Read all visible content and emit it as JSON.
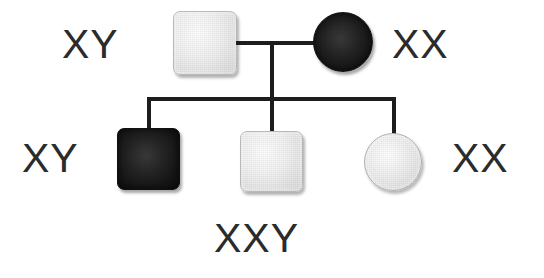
{
  "diagram": {
    "type": "pedigree-chart",
    "background_color": "#ffffff",
    "line_color": "#1d1d1d",
    "text_color": "#2b2b2b",
    "generations": 2
  },
  "labels": {
    "father_genotype": "XY",
    "mother_genotype": "XX",
    "son_affected_genotype": "XY",
    "daughter_genotype": "XX",
    "child_middle_genotype": "XXY"
  },
  "individuals": [
    {
      "id": "father",
      "shape": "square",
      "sex": "male",
      "fill": "unaffected",
      "fill_color": "#eeeeee",
      "generation": 1,
      "genotype": "XY"
    },
    {
      "id": "mother",
      "shape": "circle",
      "sex": "female",
      "fill": "affected",
      "fill_color": "#161616",
      "generation": 1,
      "genotype": "XX"
    },
    {
      "id": "child-1",
      "shape": "square",
      "sex": "male",
      "fill": "affected",
      "fill_color": "#1b1b1b",
      "generation": 2,
      "genotype": "XY"
    },
    {
      "id": "child-2",
      "shape": "square",
      "sex": "male",
      "fill": "unaffected",
      "fill_color": "#eeeeee",
      "generation": 2,
      "genotype": "XXY"
    },
    {
      "id": "child-3",
      "shape": "circle",
      "sex": "female",
      "fill": "unaffected",
      "fill_color": "#ededed",
      "generation": 2,
      "genotype": "XX"
    }
  ],
  "connectors": {
    "mating_line": "horizontal line joining father and mother",
    "descent_line": "vertical line from mating line down to sibship line",
    "sibship_line": "horizontal line spanning the three children",
    "drop_lines": 3
  }
}
